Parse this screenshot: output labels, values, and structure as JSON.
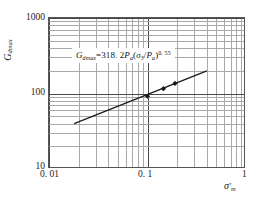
{
  "chart_data": {
    "type": "scatter",
    "title": "",
    "xlabel": "σ'ₘ",
    "ylabel": "Gₑₘₐₓ",
    "xscale": "log",
    "yscale": "log",
    "xlim": [
      0.01,
      1
    ],
    "ylim": [
      10,
      1000
    ],
    "grid": true,
    "grid_minor": true,
    "legend": "none",
    "xticks": [
      "0. 01",
      "0. 1",
      "1"
    ],
    "xtick_values": [
      0.01,
      0.1,
      1
    ],
    "yticks": [
      "1000",
      "100",
      "10"
    ],
    "ytick_values": [
      1000,
      100,
      10
    ],
    "annotation": {
      "text": "Gdmax=318. 2Pa(σ3/Pa)0.55",
      "lhs_symbol": "G",
      "lhs_sub": "dmax",
      "equals": "=",
      "coefficient": "318. 2",
      "pa_symbol": "P",
      "pa_sub": "a",
      "open_paren": "(",
      "sigma_symbol": "σ",
      "sigma_sub": "3",
      "divide": "/",
      "close_paren": ")",
      "exponent": "0. 55"
    },
    "series": [
      {
        "name": "measured",
        "marker": "diamond",
        "color": "#1a1a1a",
        "points": [
          {
            "x": 0.1,
            "y": 92
          },
          {
            "x": 0.145,
            "y": 116
          },
          {
            "x": 0.19,
            "y": 136
          }
        ]
      },
      {
        "name": "fitted power law",
        "type": "line",
        "color": "#1a1a1a",
        "endpoints": [
          {
            "x": 0.018,
            "y": 40
          },
          {
            "x": 0.4,
            "y": 200
          }
        ]
      }
    ]
  },
  "axes": {
    "y_title_main": "G",
    "y_title_sub": "dmax",
    "x_title_main": "σ",
    "x_title_prime": "′",
    "x_title_sub": "m"
  }
}
